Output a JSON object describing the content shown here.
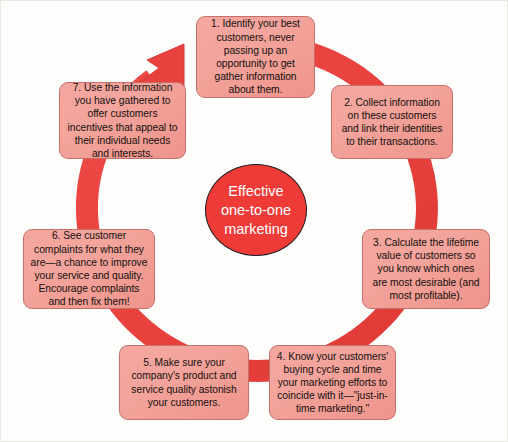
{
  "diagram": {
    "title_center": "Effective\none-to-one\nmarketing",
    "center_line1": "Effective",
    "center_line2": "one-to-one",
    "center_line3": "marketing",
    "accent_color": "#ef3b38",
    "box_fill_color": "#f2a49c",
    "box_border_color": "#c4706b",
    "arrow_color": "#e8413e",
    "background_color": "#fdfdfb",
    "text_color": "#14110f",
    "steps": [
      {
        "number": "1",
        "text": "1. Identify your best customers, never passing up an opportunity to get gather information about them."
      },
      {
        "number": "2",
        "text": "2. Collect information on these customers and link their identities to their transactions."
      },
      {
        "number": "3",
        "text": "3. Calculate the lifetime value of customers so you know which ones are most desirable (and most profitable)."
      },
      {
        "number": "4",
        "text": "4. Know your customers' buying cycle and time your marketing efforts to coincide with it—\"just-in-time marketing.\""
      },
      {
        "number": "5",
        "text": "5. Make sure your company's product and service quality astonish your customers."
      },
      {
        "number": "6",
        "text": "6. See customer complaints for what they are—a chance to improve your service and quality. Encourage complaints and then fix them!"
      },
      {
        "number": "7",
        "text": "7. Use the information you have gathered to offer customers incentives that appeal to their individual needs and interests."
      }
    ]
  }
}
